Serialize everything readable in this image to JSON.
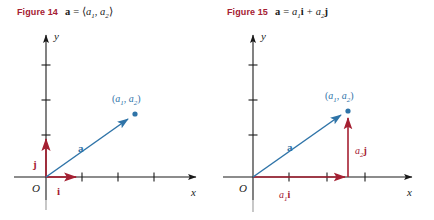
{
  "page": {
    "background": "#ffffff",
    "width": 434,
    "height": 220
  },
  "colors": {
    "figure_label_red": "#a52032",
    "vector_blue": "#2f74a8",
    "vector_red": "#a52032",
    "axis_black": "#1a1a1a",
    "text_black": "#1a1a1a"
  },
  "figures": [
    {
      "id": "figure-14",
      "label": "Figure 14",
      "caption": {
        "vector_symbol": "a",
        "equals": "=",
        "expression_open": "⟨",
        "comp1_base": "a",
        "comp1_sub": "1",
        "comma": ",",
        "comp2_base": "a",
        "comp2_sub": "2",
        "expression_close": "⟩",
        "full_text": "a = ⟨a₁, a₂⟩"
      },
      "axes": {
        "x_label": "x",
        "y_label": "y",
        "origin_label": "O",
        "x_ticks": 3,
        "y_ticks": 3
      },
      "annotations": {
        "point_label_open": "(",
        "point_comp1_base": "a",
        "point_comp1_sub": "1",
        "point_comma": ",",
        "point_comp2_base": "a",
        "point_comp2_sub": "2",
        "point_label_close": ")",
        "point_label_full": "(a₁, a₂)",
        "vector_label": "a",
        "unit_i_label": "i",
        "unit_j_label": "j"
      }
    },
    {
      "id": "figure-15",
      "label": "Figure 15",
      "caption": {
        "vector_symbol": "a",
        "equals": "=",
        "term1_coeff_base": "a",
        "term1_coeff_sub": "1",
        "term1_unit": "i",
        "plus": "+",
        "term2_coeff_base": "a",
        "term2_coeff_sub": "2",
        "term2_unit": "j",
        "full_text": "a = a₁i + a₂j"
      },
      "axes": {
        "x_label": "x",
        "y_label": "y",
        "origin_label": "O",
        "x_ticks": 3,
        "y_ticks": 3
      },
      "annotations": {
        "point_label_open": "(",
        "point_comp1_base": "a",
        "point_comp1_sub": "1",
        "point_comma": ",",
        "point_comp2_base": "a",
        "point_comp2_sub": "2",
        "point_label_close": ")",
        "point_label_full": "(a₁, a₂)",
        "vector_label": "a",
        "horiz_component_base": "a",
        "horiz_component_sub": "1",
        "horiz_component_unit": "i",
        "horiz_component_full": "a₁i",
        "vert_component_base": "a",
        "vert_component_sub": "2",
        "vert_component_unit": "j",
        "vert_component_full": "a₂j"
      }
    }
  ]
}
